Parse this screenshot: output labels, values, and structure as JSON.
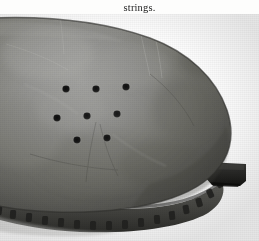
{
  "page": {
    "background_color": "#fdfdfc",
    "width": 259,
    "height": 241
  },
  "caption": {
    "text": "strings.",
    "color": "#1b1b1b"
  },
  "figure": {
    "name": "perforated-leaf-shaped-artifact-photograph",
    "palette": {
      "background": "#ffffff",
      "body_light": "#8f8f8d",
      "body_mid": "#74746f",
      "body_dark": "#5a5a56",
      "body_darkest": "#3e3e3b",
      "rim_shadow": "#3a3a37",
      "hole_fill": "#111111",
      "tang": "#2b2b29",
      "highlight": "#a6a6a2"
    },
    "holes": [
      {
        "id": "hole-1",
        "cx": 66,
        "cy": 75,
        "r": 3.6
      },
      {
        "id": "hole-2",
        "cx": 96,
        "cy": 75,
        "r": 3.6
      },
      {
        "id": "hole-3",
        "cx": 126,
        "cy": 73,
        "r": 3.6
      },
      {
        "id": "hole-4",
        "cx": 57,
        "cy": 104,
        "r": 3.6
      },
      {
        "id": "hole-5",
        "cx": 87,
        "cy": 102,
        "r": 3.6
      },
      {
        "id": "hole-6",
        "cx": 117,
        "cy": 100,
        "r": 3.6
      },
      {
        "id": "hole-7",
        "cx": 77,
        "cy": 126,
        "r": 3.6
      },
      {
        "id": "hole-8",
        "cx": 107,
        "cy": 124,
        "r": 3.6
      }
    ],
    "hole_count": 8,
    "rim_notch_count": 17,
    "tang": {
      "x": 212,
      "y": 148,
      "width": 34,
      "height": 22
    }
  }
}
